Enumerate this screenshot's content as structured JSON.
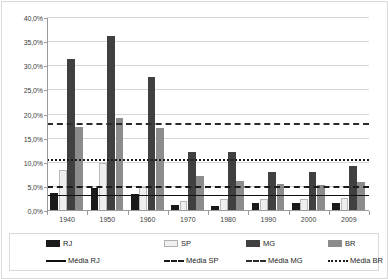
{
  "chart_data": {
    "type": "bar",
    "title": "",
    "subtitle": "",
    "xlabel": "",
    "ylabel": "",
    "categories": [
      "1940",
      "1950",
      "1960",
      "1970",
      "1980",
      "1990",
      "2000",
      "2009"
    ],
    "ylim": [
      0,
      40
    ],
    "ytick_labels": [
      "0,0%",
      "5,0%",
      "10,0%",
      "15,0%",
      "20,0%",
      "25,0%",
      "30,0%",
      "35,0%",
      "40,0%"
    ],
    "ytick_values": [
      0,
      5,
      10,
      15,
      20,
      25,
      30,
      35,
      40
    ],
    "grid": true,
    "legend_position": "bottom",
    "series": [
      {
        "name": "RJ",
        "color": "#1a1a1a",
        "kind": "bar",
        "values": [
          3.8,
          4.8,
          3.5,
          1.3,
          1.1,
          1.6,
          1.6,
          1.7
        ]
      },
      {
        "name": "SP",
        "color": "#efefef",
        "kind": "bar",
        "values": [
          8.5,
          10.0,
          5.0,
          2.0,
          2.4,
          2.4,
          2.5,
          2.8
        ]
      },
      {
        "name": "MG",
        "color": "#404040",
        "kind": "bar",
        "values": [
          31.5,
          36.3,
          27.8,
          12.3,
          12.3,
          8.0,
          8.0,
          9.3
        ]
      },
      {
        "name": "BR",
        "color": "#8c8c8c",
        "kind": "bar",
        "values": [
          17.5,
          19.3,
          17.3,
          7.3,
          6.3,
          5.5,
          5.3,
          6.0
        ]
      }
    ],
    "reference_lines": [
      {
        "name": "Média RJ",
        "value": 3.2,
        "style": "solid",
        "color": "#101010"
      },
      {
        "name": "Média SP",
        "value": 4.7,
        "style": "dashed",
        "color": "#1a1a1a"
      },
      {
        "name": "Média MG",
        "value": 17.8,
        "style": "dash-dot",
        "color": "#2b2b2b"
      },
      {
        "name": "Média BR",
        "value": 10.4,
        "style": "dotted",
        "color": "#1a1a1a"
      }
    ]
  },
  "legend": {
    "row1": [
      {
        "label": "RJ",
        "swatch": "rj"
      },
      {
        "label": "SP",
        "swatch": "sp"
      },
      {
        "label": "MG",
        "swatch": "mg"
      },
      {
        "label": "BR",
        "swatch": "br"
      }
    ],
    "row2": [
      {
        "label": "Média RJ",
        "swatch": "media-rj"
      },
      {
        "label": "Média SP",
        "swatch": "media-sp"
      },
      {
        "label": "Média MG",
        "swatch": "media-mg"
      },
      {
        "label": "Média BR",
        "swatch": "media-br"
      }
    ]
  }
}
